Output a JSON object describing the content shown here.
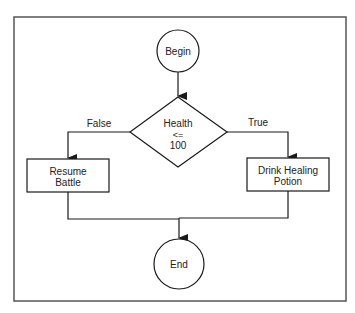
{
  "diagram": {
    "type": "flowchart",
    "nodes": {
      "begin": {
        "label": "Begin",
        "shape": "circle"
      },
      "decision": {
        "line1": "Health",
        "line2": "<=",
        "line3": "100",
        "shape": "diamond"
      },
      "resume": {
        "line1": "Resume",
        "line2": "Battle",
        "shape": "rectangle"
      },
      "drink": {
        "line1": "Drink Healing",
        "line2": "Potion",
        "shape": "rectangle"
      },
      "end": {
        "label": "End",
        "shape": "circle"
      }
    },
    "edges": {
      "false_label": "False",
      "true_label": "True"
    },
    "colors": {
      "stroke": "#1a1a1a",
      "frame": "#555555",
      "text": "#222222"
    }
  }
}
